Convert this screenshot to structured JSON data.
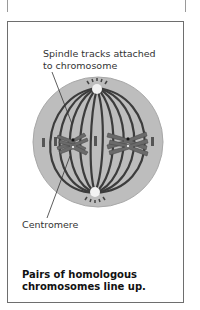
{
  "figure": {
    "labels": {
      "spindle_tracks": "Spindle tracks attached to chromosome",
      "centromere": "Centromere"
    },
    "caption": "Pairs of homologous chromosomes line up.",
    "colors": {
      "cell_fill": "#bdbdbd",
      "cell_border": "#a8a8a8",
      "spindle": "#3c3c3c",
      "chromosome": "#6a6a6a",
      "frame": "#6e6e6e"
    }
  }
}
